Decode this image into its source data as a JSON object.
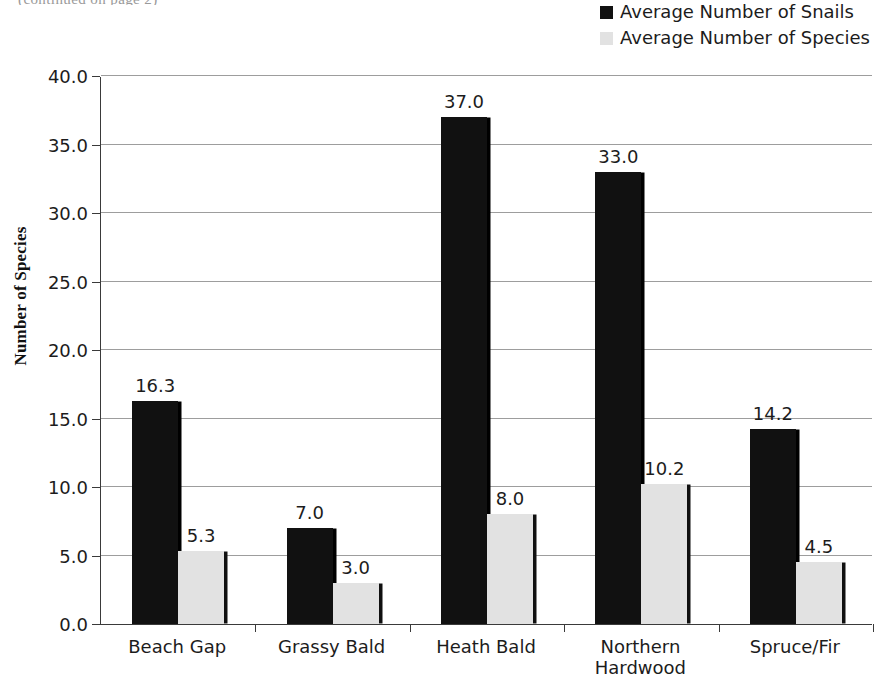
{
  "clipped_header_text": "(continued on page 2)",
  "legend": {
    "position": "top-right",
    "items": [
      {
        "label": "Average Number of Snails",
        "color": "#111111",
        "name": "snails"
      },
      {
        "label": "Average Number of Species",
        "color": "#e2e2e2",
        "name": "species"
      }
    ]
  },
  "axes": {
    "y_title": "Number of Species",
    "y_ticks": [
      "0.0",
      "5.0",
      "10.0",
      "15.0",
      "20.0",
      "25.0",
      "30.0",
      "35.0",
      "40.0"
    ]
  },
  "chart_data": {
    "type": "bar",
    "title": "",
    "xlabel": "",
    "ylabel": "Number of Species",
    "ylim": [
      0,
      40
    ],
    "ytick_step": 5,
    "grid": true,
    "legend_position": "top-right",
    "categories": [
      "Beach Gap",
      "Grassy Bald",
      "Heath Bald",
      "Northern\nHardwood",
      "Spruce/Fir"
    ],
    "series": [
      {
        "name": "Average Number of Snails",
        "color": "#111111",
        "values": [
          16.3,
          7.0,
          37.0,
          33.0,
          14.2
        ],
        "labels": [
          "16.3",
          "7.0",
          "37.0",
          "33.0",
          "14.2"
        ]
      },
      {
        "name": "Average Number of Species",
        "color": "#e2e2e2",
        "values": [
          5.3,
          3.0,
          8.0,
          10.2,
          4.5
        ],
        "labels": [
          "5.3",
          "3.0",
          "8.0",
          "10.2",
          "4.5"
        ]
      }
    ]
  }
}
